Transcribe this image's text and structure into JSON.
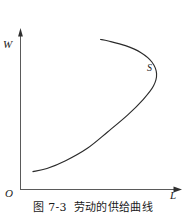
{
  "figure": {
    "caption_number": "图 7-3",
    "caption_title": "劳动的供给曲线",
    "background_color": "#ffffff",
    "line_color": "#2b2b2b",
    "axis_color": "#555555"
  },
  "axes": {
    "y_label": "W",
    "x_label": "L",
    "origin_label": "O",
    "y_axis_name": "wage-axis",
    "x_axis_name": "labor-axis"
  },
  "curve": {
    "label": "S",
    "name": "labor-supply-curve"
  },
  "chart_data": {
    "type": "line",
    "title": "劳动的供给曲线",
    "xlabel": "L",
    "ylabel": "W",
    "grid": false,
    "legend": "none",
    "annotations": [
      {
        "text": "S",
        "x": 0.86,
        "y": 0.7
      },
      {
        "text": "O",
        "x": 0.0,
        "y": 0.0
      }
    ],
    "xlim": [
      0,
      1
    ],
    "ylim": [
      0,
      1
    ],
    "series": [
      {
        "name": "S",
        "description": "backward-bending labor supply curve",
        "points": [
          {
            "x": 0.08,
            "y": 0.115
          },
          {
            "x": 0.17,
            "y": 0.135
          },
          {
            "x": 0.29,
            "y": 0.185
          },
          {
            "x": 0.43,
            "y": 0.265
          },
          {
            "x": 0.56,
            "y": 0.37
          },
          {
            "x": 0.69,
            "y": 0.48
          },
          {
            "x": 0.79,
            "y": 0.58
          },
          {
            "x": 0.855,
            "y": 0.665
          },
          {
            "x": 0.875,
            "y": 0.745
          },
          {
            "x": 0.845,
            "y": 0.82
          },
          {
            "x": 0.775,
            "y": 0.88
          },
          {
            "x": 0.675,
            "y": 0.925
          },
          {
            "x": 0.565,
            "y": 0.955
          },
          {
            "x": 0.515,
            "y": 0.965
          }
        ]
      }
    ]
  }
}
